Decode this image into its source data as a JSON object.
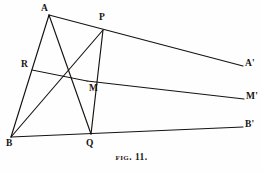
{
  "figure": {
    "caption_prefix": "Fig.",
    "caption_number": "11.",
    "caption_full": "FIG. 11.",
    "width": 263,
    "height": 174,
    "stroke_color": "#16120f",
    "background_color": "#fefefe"
  },
  "points": [
    {
      "id": "A",
      "label": "A",
      "x": 49,
      "y": 15,
      "label_x": 41,
      "label_y": 4
    },
    {
      "id": "P",
      "label": "P",
      "x": 103,
      "y": 30,
      "label_x": 99,
      "label_y": 13
    },
    {
      "id": "R",
      "label": "R",
      "x": 32,
      "y": 70,
      "label_x": 21,
      "label_y": 60
    },
    {
      "id": "M",
      "label": "M",
      "x": 87,
      "y": 81,
      "label_x": 89,
      "label_y": 84
    },
    {
      "id": "B",
      "label": "B",
      "x": 11,
      "y": 137,
      "label_x": 6,
      "label_y": 139
    },
    {
      "id": "Q",
      "label": "Q",
      "x": 91,
      "y": 134,
      "label_x": 86,
      "label_y": 139
    },
    {
      "id": "Ap",
      "label": "A'",
      "x": 243,
      "y": 66,
      "label_x": 245,
      "label_y": 59
    },
    {
      "id": "Mp",
      "label": "M'",
      "x": 244,
      "y": 99,
      "label_x": 246,
      "label_y": 92
    },
    {
      "id": "Bp",
      "label": "B'",
      "x": 243,
      "y": 127,
      "label_x": 245,
      "label_y": 120
    }
  ],
  "segments": [
    {
      "name": "ray-A-to-Aprime",
      "from": "A",
      "to": "Ap",
      "x1": 49,
      "y1": 15,
      "x2": 243,
      "y2": 66
    },
    {
      "name": "ray-M-to-Mprime",
      "from": "M",
      "to": "Mp",
      "x1": 87,
      "y1": 81,
      "x2": 244,
      "y2": 99
    },
    {
      "name": "ray-B-to-Bprime",
      "from": "B",
      "to": "Bp",
      "x1": 11,
      "y1": 137,
      "x2": 243,
      "y2": 127
    },
    {
      "name": "side-A-to-B",
      "from": "A",
      "to": "B",
      "x1": 49,
      "y1": 15,
      "x2": 11,
      "y2": 137
    },
    {
      "name": "segment-R-to-M",
      "from": "R",
      "to": "M",
      "x1": 32,
      "y1": 70,
      "x2": 87,
      "y2": 81
    },
    {
      "name": "cevian-A-to-Q",
      "from": "A",
      "to": "Q",
      "x1": 49,
      "y1": 15,
      "x2": 91,
      "y2": 134
    },
    {
      "name": "cevian-B-to-P",
      "from": "B",
      "to": "P",
      "x1": 11,
      "y1": 137,
      "x2": 103,
      "y2": 30
    },
    {
      "name": "transversal-P-to-Q",
      "from": "P",
      "to": "Q",
      "x1": 103,
      "y1": 30,
      "x2": 91,
      "y2": 134
    }
  ]
}
